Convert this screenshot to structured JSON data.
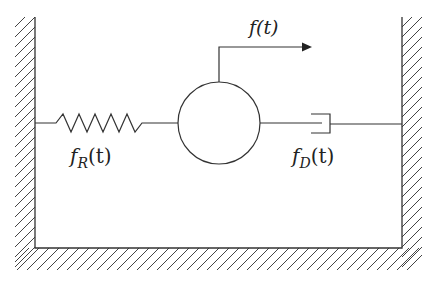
{
  "diagram": {
    "type": "mass-spring-damper schematic",
    "labels": {
      "applied_force": "f(t)",
      "spring_force_main": "f",
      "spring_force_sub": "R",
      "spring_force_arg": "(t)",
      "damper_force_main": "f",
      "damper_force_sub": "D",
      "damper_force_arg": "(t)"
    },
    "components": [
      {
        "name": "left-wall",
        "kind": "fixed support"
      },
      {
        "name": "right-wall",
        "kind": "fixed support"
      },
      {
        "name": "floor",
        "kind": "fixed support"
      },
      {
        "name": "spring",
        "kind": "spring",
        "force_label": "f_R(t)"
      },
      {
        "name": "mass",
        "kind": "circle mass"
      },
      {
        "name": "damper",
        "kind": "dashpot",
        "force_label": "f_D(t)"
      },
      {
        "name": "force-arrow",
        "kind": "applied force",
        "direction": "right",
        "force_label": "f(t)"
      }
    ],
    "colors": {
      "stroke": "#333333",
      "background": "#ffffff"
    }
  }
}
